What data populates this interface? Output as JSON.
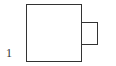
{
  "diagram": {
    "label": "1",
    "shapes": [
      {
        "type": "square",
        "role": "main"
      },
      {
        "type": "square",
        "role": "attached-right"
      }
    ],
    "stroke_color": "#333333"
  }
}
